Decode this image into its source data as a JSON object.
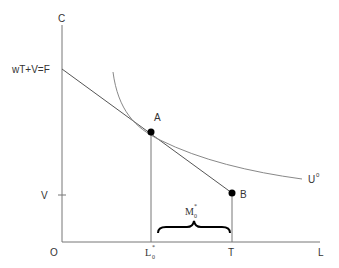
{
  "diagram": {
    "axes": {
      "y_label": "C",
      "x_label": "L",
      "origin_label": "O"
    },
    "y_ticks": {
      "endowment_label": "wT+V=F",
      "nonlabor_income_label": "V"
    },
    "x_ticks": {
      "optimal_hours_label_base": "L",
      "optimal_hours_label_sup": "*",
      "optimal_hours_label_sub": "0",
      "time_endowment_label": "T"
    },
    "points": {
      "optimum": "A",
      "endowment": "B"
    },
    "curves": {
      "indifference_label_base": "U",
      "indifference_label_sup": "0"
    },
    "brace": {
      "label_base": "M",
      "label_sup": "*",
      "label_sub": "0"
    },
    "colors": {
      "line": "#555555",
      "curve": "#888888",
      "point": "#000000",
      "text": "#333333"
    }
  }
}
